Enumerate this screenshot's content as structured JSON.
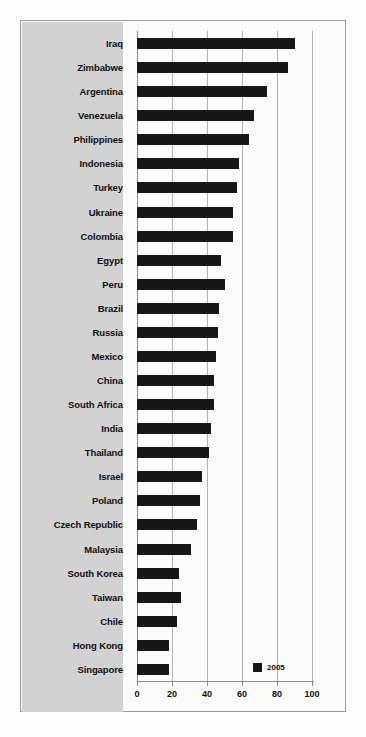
{
  "chart_data": {
    "type": "bar",
    "orientation": "horizontal",
    "title": "",
    "subtitle": "",
    "xlabel": "",
    "ylabel": "",
    "xlim": [
      0,
      100
    ],
    "xticks": [
      0,
      20,
      40,
      60,
      80,
      100
    ],
    "xtick_labels": [
      "0",
      "20",
      "40",
      "60",
      "80",
      "100"
    ],
    "grid": true,
    "grid_axis": "x",
    "legend": {
      "position": "inside-bottom-right",
      "entries": [
        {
          "label": "2005",
          "color": "#171717"
        }
      ]
    },
    "series": [
      {
        "name": "2005",
        "color": "#171717",
        "values": [
          90,
          86,
          74,
          67,
          64,
          58,
          57,
          55,
          55,
          48,
          50,
          47,
          46,
          45,
          44,
          44,
          42,
          41,
          37,
          36,
          34,
          31,
          24,
          25,
          23,
          18,
          18
        ]
      }
    ],
    "categories": [
      "Iraq",
      "Zimbabwe",
      "Argentina",
      "Venezuela",
      "Philippines",
      "Indonesia",
      "Turkey",
      "Ukraine",
      "Colombia",
      "Egypt",
      "Peru",
      "Brazil",
      "Russia",
      "Mexico",
      "China",
      "South Africa",
      "India",
      "Thailand",
      "Israel",
      "Poland",
      "Czech Republic",
      "Malaysia",
      "South Korea",
      "Taiwan",
      "Chile",
      "Hong Kong",
      "Singapore"
    ],
    "points": [
      {
        "category": "Iraq",
        "value": 90
      },
      {
        "category": "Zimbabwe",
        "value": 86
      },
      {
        "category": "Argentina",
        "value": 74
      },
      {
        "category": "Venezuela",
        "value": 67
      },
      {
        "category": "Philippines",
        "value": 64
      },
      {
        "category": "Indonesia",
        "value": 58
      },
      {
        "category": "Turkey",
        "value": 57
      },
      {
        "category": "Ukraine",
        "value": 55
      },
      {
        "category": "Colombia",
        "value": 55
      },
      {
        "category": "Egypt",
        "value": 48
      },
      {
        "category": "Peru",
        "value": 50
      },
      {
        "category": "Brazil",
        "value": 47
      },
      {
        "category": "Russia",
        "value": 46
      },
      {
        "category": "Mexico",
        "value": 45
      },
      {
        "category": "China",
        "value": 44
      },
      {
        "category": "South Africa",
        "value": 44
      },
      {
        "category": "India",
        "value": 42
      },
      {
        "category": "Thailand",
        "value": 41
      },
      {
        "category": "Israel",
        "value": 37
      },
      {
        "category": "Poland",
        "value": 36
      },
      {
        "category": "Czech Republic",
        "value": 34
      },
      {
        "category": "Malaysia",
        "value": 31
      },
      {
        "category": "South Korea",
        "value": 24
      },
      {
        "category": "Taiwan",
        "value": 25
      },
      {
        "category": "Chile",
        "value": 23
      },
      {
        "category": "Hong Kong",
        "value": 18
      },
      {
        "category": "Singapore",
        "value": 18
      }
    ]
  },
  "colors": {
    "bar": "#171717",
    "label_panel": "#d2d2d2",
    "grid": "#b3b3b3",
    "axis": "#8c8c8c",
    "frame": "#9a9a9a",
    "background": "#fbfbfb"
  }
}
